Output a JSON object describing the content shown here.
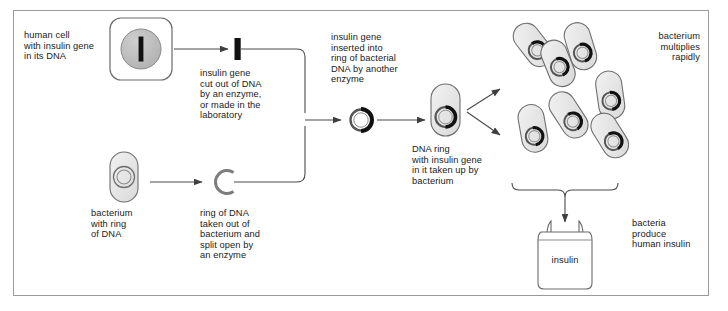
{
  "diagram": {
    "labels": {
      "human_cell": "human cell\nwith insulin gene\nin its DNA",
      "insulin_gene_cut": "insulin gene\ncut out of DNA\nby an enzyme,\nor made in the\nlaboratory",
      "bacterium_ring": "bacterium\nwith ring\nof DNA",
      "ring_split": "ring of DNA\ntaken out of\nbacterium and\nsplit open by\nan enzyme",
      "gene_inserted": "insulin gene\ninserted into\nring of bacterial\nDNA by another\nenzyme",
      "ring_taken_up": "DNA ring\nwith insulin gene\nin it taken up by\nbacterium",
      "multiplies": "bacterium\nmultiplies\nrapidly",
      "produce_insulin": "bacteria\nproduce\nhuman insulin",
      "bottle": "insulin"
    },
    "colors": {
      "frame_border": "#9a9a9a",
      "stroke": "#4a4a4a",
      "text": "#1a1a1a",
      "nucleus_fill": "#b8b8b8",
      "gene_black": "#111111",
      "cell_fill": "#ffffff",
      "bacterium_fill": "#e8e8e8",
      "bottle_fill": "#ffffff"
    },
    "counts": {
      "bacteria_cluster": 7
    }
  }
}
